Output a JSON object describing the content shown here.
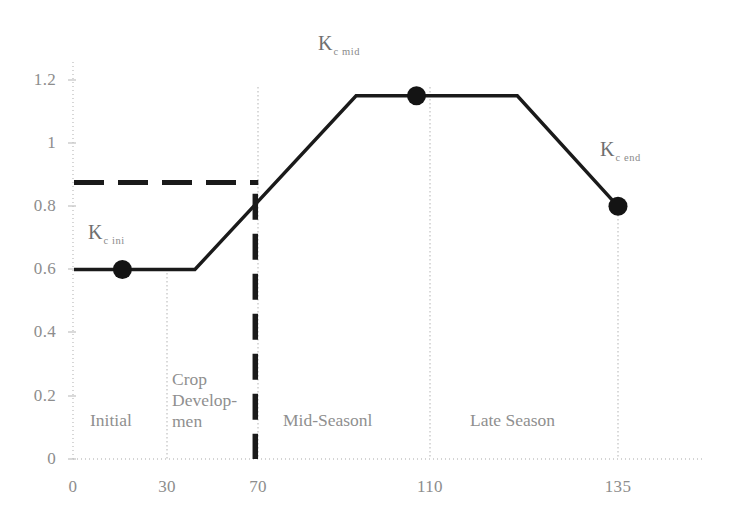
{
  "chart_data": {
    "type": "line",
    "title": "",
    "xlabel": "",
    "ylabel": "",
    "xlim": [
      0,
      145
    ],
    "ylim": [
      0,
      1.28
    ],
    "grid": false,
    "legend": "none",
    "x_ticks": [
      "0",
      "30",
      "70",
      "110",
      "135"
    ],
    "x_tick_values": [
      0,
      30,
      70,
      110,
      135
    ],
    "y_ticks": [
      "0",
      "0.2",
      "0.4",
      "0.6",
      "0.8",
      "1",
      "1.2"
    ],
    "y_tick_values": [
      0,
      0.2,
      0.4,
      0.6,
      0.8,
      1,
      1.2
    ],
    "series": [
      {
        "name": "Kc curve",
        "style": "solid",
        "x": [
          0,
          30,
          70,
          110,
          135
        ],
        "values": [
          0.6,
          0.6,
          1.15,
          1.15,
          0.8
        ]
      },
      {
        "name": "Kc adjusted reference",
        "style": "dashed",
        "x": [
          0,
          45
        ],
        "values": [
          0.875,
          0.875
        ]
      }
    ],
    "markers": [
      {
        "label": "Kc ini",
        "x": 12,
        "y": 0.6
      },
      {
        "label": "Kc mid",
        "x": 85,
        "y": 1.15
      },
      {
        "label": "Kc end",
        "x": 135,
        "y": 0.8
      }
    ],
    "vertical_dashed": {
      "x": 45,
      "y_top": 0.84,
      "y_bottom": 0.0
    },
    "stage_dividers": [
      30,
      70,
      110,
      135
    ]
  },
  "labels": {
    "kc_ini": {
      "base": "K",
      "sub": "c ini"
    },
    "kc_mid": {
      "base": "K",
      "sub": "c mid"
    },
    "kc_end": {
      "base": "K",
      "sub": "c end"
    }
  },
  "stages": [
    {
      "name": "initial",
      "text": "Initial"
    },
    {
      "name": "crop-development",
      "line1": "Crop",
      "line2": "Develop-",
      "line3": "men"
    },
    {
      "name": "mid-season",
      "text": "Mid-Seasonl"
    },
    {
      "name": "late-season",
      "text": "Late Season"
    }
  ],
  "colors": {
    "curve": "#1a1a1a",
    "axis": "#bdbdbd",
    "divider": "#c9c9c9",
    "tick_text": "#8d8d8d",
    "stage_text": "#8f8f8f",
    "kc_text": "#6f6f6f",
    "background": "#ffffff"
  }
}
